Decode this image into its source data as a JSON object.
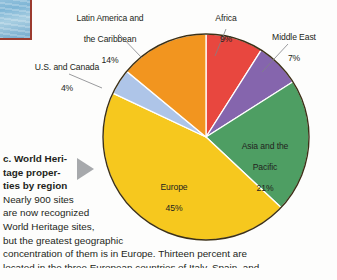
{
  "figure": {
    "caption_label": "c.",
    "caption_heading": "World Heritage properties by region",
    "heading_lines": [
      "c. World Heri-",
      "tage proper-",
      "ties by region"
    ],
    "body_lines": [
      "Nearly 900 sites",
      "are now recognized",
      "World Heritage sites,",
      "but the greatest geographic",
      "concentration of them is in Europe. Thirteen percent are",
      "located in the three European countries of Italy, Spain, and"
    ],
    "marker_icon": "triangle-right-icon",
    "photo_icon": "photo-thumbnail"
  },
  "chart_data": {
    "type": "pie",
    "unit": "%",
    "total_label": "Nearly 900 sites",
    "start_angle_deg": 0,
    "direction": "clockwise",
    "categories": [
      "Africa",
      "Middle East",
      "Asia and the Pacific",
      "Europe",
      "U.S. and Canada",
      "Latin America and the Caribbean"
    ],
    "values": [
      9,
      7,
      21,
      45,
      4,
      14
    ],
    "colors": [
      "#e8473f",
      "#8565ad",
      "#4e9e63",
      "#f6c81e",
      "#aec5e8",
      "#f2951f"
    ],
    "label_placement": [
      "outside",
      "outside",
      "inside",
      "inside",
      "outside",
      "outside"
    ],
    "slices": [
      {
        "name": "Africa",
        "value": 9,
        "pct_text": "9%",
        "color": "#e8473f",
        "label_lines": [
          "Africa"
        ]
      },
      {
        "name": "Middle East",
        "value": 7,
        "pct_text": "7%",
        "color": "#8565ad",
        "label_lines": [
          "Middle East"
        ]
      },
      {
        "name": "Asia and the Pacific",
        "value": 21,
        "pct_text": "21%",
        "color": "#4e9e63",
        "label_lines": [
          "Asia and the",
          "Pacific"
        ]
      },
      {
        "name": "Europe",
        "value": 45,
        "pct_text": "45%",
        "color": "#f6c81e",
        "label_lines": [
          "Europe"
        ]
      },
      {
        "name": "U.S. and Canada",
        "value": 4,
        "pct_text": "4%",
        "color": "#aec5e8",
        "label_lines": [
          "U.S. and Canada"
        ]
      },
      {
        "name": "Latin America and the Caribbean",
        "value": 14,
        "pct_text": "14%",
        "color": "#f2951f",
        "label_lines": [
          "Latin America and",
          "the Caribbean"
        ]
      }
    ],
    "legend": "none",
    "grid": false
  },
  "style": {
    "background": "#fdfdfc",
    "text_color": "#231f20",
    "outline_color": "#3d3117",
    "leader_color": "#808285",
    "marker_color": "#a7a9ac"
  }
}
